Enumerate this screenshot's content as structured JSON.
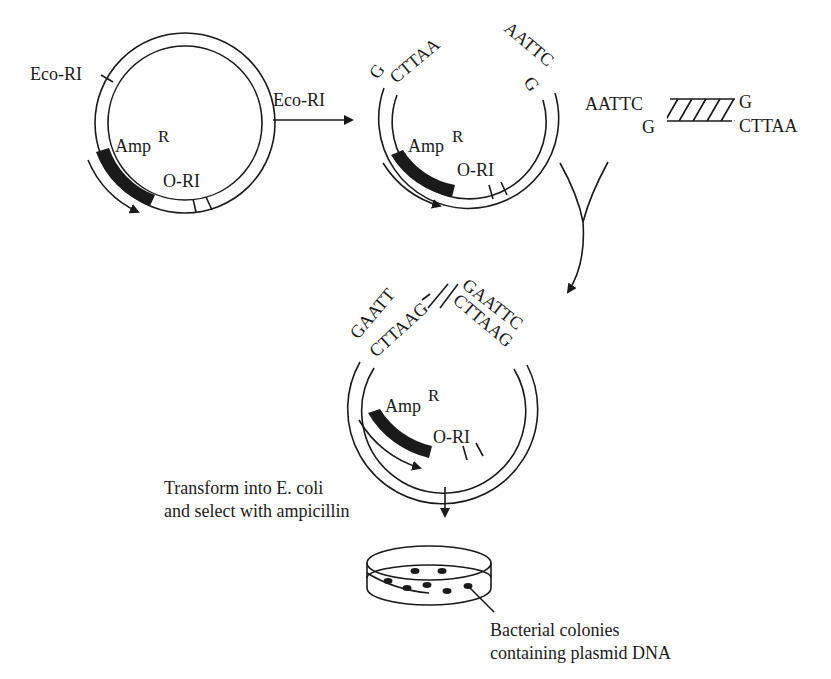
{
  "diagram": {
    "type": "molecular-cloning-workflow",
    "colors": {
      "ink": "#1a1a1a",
      "background": "#ffffff"
    },
    "plasmid_1": {
      "site_label": "Eco-RI",
      "resistance_gene": "Amp",
      "resistance_sup": "R",
      "origin_label": "O-RI"
    },
    "step_1": {
      "enzyme_label": "Eco-RI",
      "arrow": "right-arrow"
    },
    "plasmid_2": {
      "left_end_top": "G",
      "left_end_bottom": "CTTAA",
      "right_end_top": "AATTC",
      "right_end_bottom": "G",
      "resistance_gene": "Amp",
      "resistance_sup": "R",
      "origin_label": "O-RI"
    },
    "insert_fragment": {
      "left_top": "AATTC",
      "left_bottom": "G",
      "right_top": "G",
      "right_bottom": "CTTAA"
    },
    "plasmid_3": {
      "left_junction_top": "GAATT",
      "left_junction_bottom": "CTTAAG",
      "right_junction_top": "GAATTC",
      "right_junction_bottom": "CTTAAG",
      "resistance_gene": "Amp",
      "resistance_sup": "R",
      "origin_label": "O-RI"
    },
    "step_3": {
      "line_1": "Transform into E. coli",
      "line_2": "and select with ampicillin"
    },
    "petri_dish": {
      "colony_count": 8,
      "label_line_1": "Bacterial colonies",
      "label_line_2": "containing plasmid DNA"
    }
  }
}
